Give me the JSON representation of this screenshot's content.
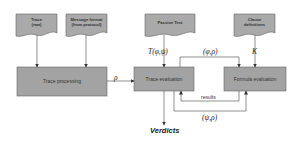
{
  "diagram": {
    "inputs": [
      {
        "id": "trace",
        "label": "Trace (raw)",
        "line1": "Trace",
        "line2": "(raw)"
      },
      {
        "id": "message_format",
        "label": "Message format (from protocol)",
        "line1": "Message format",
        "line2": "(from protocol)"
      },
      {
        "id": "passive_test",
        "label": "Passive Test",
        "line1": "Passive Test"
      },
      {
        "id": "clause_definitions",
        "label": "Clause definitions",
        "line1": "Clause",
        "line2": "definitions"
      }
    ],
    "processes": [
      {
        "id": "trace_processing",
        "label": "Trace processing"
      },
      {
        "id": "trace_evaluation",
        "label": "Trace evaluation"
      },
      {
        "id": "formula_evaluation",
        "label": "Formula evaluation"
      }
    ],
    "edges": [
      {
        "from": "trace",
        "to": "trace_processing",
        "label": ""
      },
      {
        "from": "message_format",
        "to": "trace_processing",
        "label": ""
      },
      {
        "from": "trace_processing",
        "to": "trace_evaluation",
        "label": "ρ"
      },
      {
        "from": "passive_test",
        "to": "trace_evaluation",
        "label": "T(φ,ψ)"
      },
      {
        "from": "trace_evaluation",
        "to": "formula_evaluation",
        "label": "(φ,ρ)"
      },
      {
        "from": "clause_definitions",
        "to": "formula_evaluation",
        "label": "K"
      },
      {
        "from": "formula_evaluation",
        "to": "trace_evaluation",
        "label": "results"
      },
      {
        "from": "trace_evaluation",
        "to": "formula_evaluation",
        "label": "(ψ,ρ)"
      },
      {
        "from": "trace_evaluation",
        "to": "verdicts",
        "label": ""
      }
    ],
    "output": {
      "label": "Verdicts"
    },
    "colors": {
      "doc_fill": "#a9a9a9",
      "process_fill": "#a3a3a3",
      "stroke": "#555555",
      "line": "#444444"
    }
  }
}
